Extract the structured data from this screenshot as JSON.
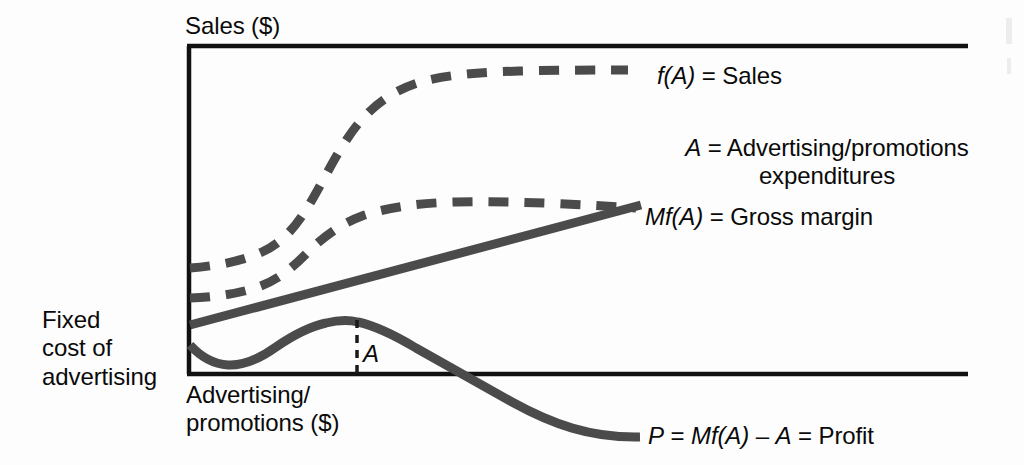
{
  "figure": {
    "kind": "economics-concept-graph",
    "axes": {
      "y_axis_title": "Sales ($)",
      "x_axis_title": "Advertising/\npromotions ($)",
      "y_origin_annotation": "Fixed\ncost of\nadvertising"
    },
    "plot_annotations": {
      "optimum_marker": "A"
    },
    "legend": [
      {
        "key": "sales",
        "label": "f(A) = Sales",
        "style": "dashed",
        "color": "#4b4b4b"
      },
      {
        "key": "advertising",
        "label": "A = Advertising/promotions\nexpenditures",
        "style": "solid",
        "color": "#4b4b4b"
      },
      {
        "key": "gross_margin",
        "label": "Mf(A) = Gross margin",
        "style": "dashed",
        "color": "#4b4b4b"
      },
      {
        "key": "profit",
        "label": "P = Mf(A) – A = Profit",
        "style": "solid",
        "color": "#4b4b4b"
      }
    ],
    "colors": {
      "axis": "#111111",
      "curve": "#4b4b4b",
      "background": "#fdfdfd"
    }
  },
  "chart_data": {
    "type": "line",
    "title": "",
    "xlabel": "Advertising/promotions ($)",
    "ylabel": "Sales ($)",
    "xlim": [
      0,
      100
    ],
    "ylim": [
      0,
      100
    ],
    "grid": false,
    "legend_position": "right",
    "annotations": [
      {
        "text": "A",
        "x": 22,
        "y": 9,
        "note": "optimum advertising level at profit peak"
      },
      {
        "text": "Fixed cost of advertising",
        "x": 0,
        "y": 11,
        "note": "y-intercept region of profit curve"
      }
    ],
    "series": [
      {
        "name": "f(A) = Sales",
        "style": "dashed",
        "color": "#4b4b4b",
        "x": [
          0,
          6,
          12,
          18,
          24,
          30,
          36,
          42,
          48,
          54,
          60,
          66,
          72,
          78,
          84,
          90,
          96,
          100
        ],
        "y": [
          32,
          33,
          36,
          41,
          49,
          60,
          70,
          78,
          84,
          88,
          90,
          91,
          92,
          92.5,
          93,
          93,
          93,
          93
        ]
      },
      {
        "name": "Mf(A) = Gross margin",
        "style": "dashed",
        "color": "#4b4b4b",
        "x": [
          0,
          6,
          12,
          18,
          24,
          30,
          36,
          42,
          48,
          54,
          58
        ],
        "y": [
          23,
          24,
          26,
          29,
          34,
          39,
          43,
          46,
          48,
          49,
          49.5
        ]
      },
      {
        "name": "A = Advertising/promotions expenditures",
        "style": "solid",
        "color": "#4b4b4b",
        "x": [
          0,
          58
        ],
        "y": [
          15,
          52
        ]
      },
      {
        "name": "P = Mf(A) – A = Profit",
        "style": "solid",
        "color": "#4b4b4b",
        "x": [
          0,
          4,
          8,
          12,
          16,
          20,
          22,
          26,
          32,
          38,
          43,
          48,
          52,
          58
        ],
        "y": [
          10,
          5.5,
          4.5,
          6,
          9,
          12.5,
          13.5,
          12.5,
          9,
          5,
          2,
          0,
          -3.5,
          -9
        ]
      }
    ]
  }
}
